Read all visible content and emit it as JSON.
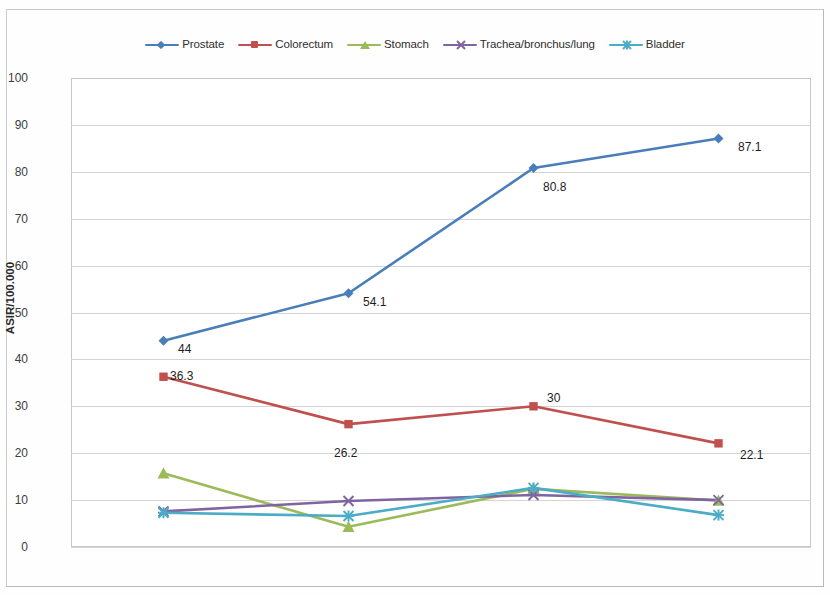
{
  "chart_data": {
    "type": "line",
    "title": "",
    "xlabel": "",
    "ylabel": "ASIR/100.000",
    "categories": [
      "2007",
      "2008",
      "2009",
      "2010"
    ],
    "ylim": [
      0,
      100
    ],
    "yticks": [
      0,
      10,
      20,
      30,
      40,
      50,
      60,
      70,
      80,
      90,
      100
    ],
    "grid": true,
    "legend_position": "top-center",
    "series": [
      {
        "name": "Prostate",
        "color": "#4a7ebb",
        "marker": "diamond",
        "values": [
          44,
          54.1,
          80.8,
          87.1
        ],
        "labels": [
          "44",
          "54.1",
          "80.8",
          "87.1"
        ]
      },
      {
        "name": "Colorectum",
        "color": "#c0504d",
        "marker": "square",
        "values": [
          36.3,
          26.2,
          30,
          22.1
        ],
        "labels": [
          "36.3",
          "26.2",
          "30",
          "22.1"
        ]
      },
      {
        "name": "Stomach",
        "color": "#9bbb59",
        "marker": "triangle",
        "values": [
          15.7,
          4.3,
          12.4,
          9.9
        ],
        "labels": [
          "",
          "",
          "",
          ""
        ]
      },
      {
        "name": "Trachea/bronchus/lung",
        "color": "#8064a2",
        "marker": "x",
        "values": [
          7.6,
          9.8,
          11.1,
          10.0
        ],
        "labels": [
          "",
          "",
          "",
          ""
        ]
      },
      {
        "name": "Bladder",
        "color": "#4bacc6",
        "marker": "star",
        "values": [
          7.3,
          6.6,
          12.6,
          6.8
        ],
        "labels": [
          "",
          "",
          "",
          ""
        ]
      }
    ],
    "point_labels": [
      {
        "series": "Prostate",
        "category": "2007",
        "text": "44",
        "x": 178,
        "y": 342
      },
      {
        "series": "Prostate",
        "category": "2008",
        "text": "54.1",
        "x": 363,
        "y": 295
      },
      {
        "series": "Prostate",
        "category": "2009",
        "text": "80.8",
        "x": 543,
        "y": 180
      },
      {
        "series": "Prostate",
        "category": "2010",
        "text": "87.1",
        "x": 738,
        "y": 140
      },
      {
        "series": "Colorectum",
        "category": "2007",
        "text": "36.3",
        "x": 170,
        "y": 369
      },
      {
        "series": "Colorectum",
        "category": "2008",
        "text": "26.2",
        "x": 334,
        "y": 446
      },
      {
        "series": "Colorectum",
        "category": "2009",
        "text": "30",
        "x": 547,
        "y": 391
      },
      {
        "series": "Colorectum",
        "category": "2010",
        "text": "22.1",
        "x": 740,
        "y": 448
      }
    ]
  }
}
